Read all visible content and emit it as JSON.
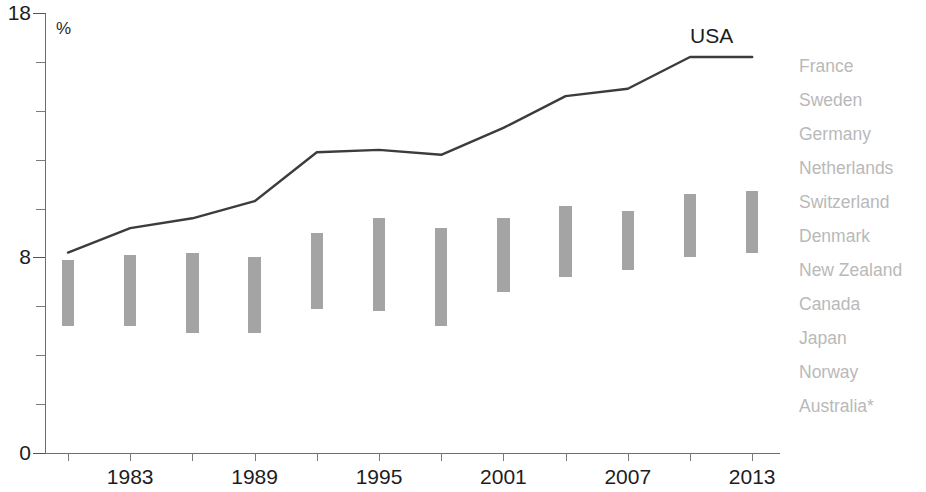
{
  "chart_data": {
    "type": "line",
    "title": "",
    "subtitle": "",
    "xlabel": "",
    "ylabel": "%",
    "unit_label": "%",
    "ylim": [
      0,
      18
    ],
    "xlim": [
      1980,
      2014
    ],
    "grid": false,
    "y_ticks": [
      0,
      2,
      4,
      6,
      8,
      10,
      12,
      14,
      16,
      18
    ],
    "y_tick_labels_shown": [
      "0",
      "8",
      "18"
    ],
    "x_ticks": [
      1980,
      1983,
      1986,
      1989,
      1992,
      1995,
      1998,
      2001,
      2004,
      2007,
      2010,
      2013
    ],
    "x_tick_labels_shown": [
      "1983",
      "1989",
      "1995",
      "2001",
      "2007",
      "2013"
    ],
    "legend_position": "right",
    "series": [
      {
        "name": "USA",
        "type": "line",
        "label_text": "USA",
        "color": "#3c3c3c",
        "x": [
          1981,
          1983,
          1986,
          1989,
          1992,
          1995,
          1998,
          2001,
          2004,
          2007,
          2010,
          2013
        ],
        "values": [
          8.2,
          9.2,
          9.6,
          10.3,
          12.3,
          12.4,
          12.2,
          13.3,
          14.6,
          14.9,
          16.2,
          16.2
        ]
      },
      {
        "name": "Other high-income countries (range)",
        "type": "range-bar",
        "color": "#9d9d9d",
        "categories": [
          1981,
          1983,
          1986,
          1989,
          1992,
          1995,
          1998,
          2001,
          2004,
          2007,
          2010,
          2013
        ],
        "low": [
          5.2,
          5.2,
          4.9,
          4.9,
          5.9,
          5.8,
          5.2,
          6.6,
          7.2,
          7.5,
          8.0,
          8.2
        ],
        "high": [
          7.9,
          8.1,
          8.2,
          8.0,
          9.0,
          9.6,
          9.2,
          9.6,
          10.1,
          9.9,
          10.6,
          10.7
        ]
      }
    ],
    "legend_entries": [
      "France",
      "Sweden",
      "Germany",
      "Netherlands",
      "Switzerland",
      "Denmark",
      "New Zealand",
      "Canada",
      "Japan",
      "Norway",
      "Australia*"
    ]
  }
}
